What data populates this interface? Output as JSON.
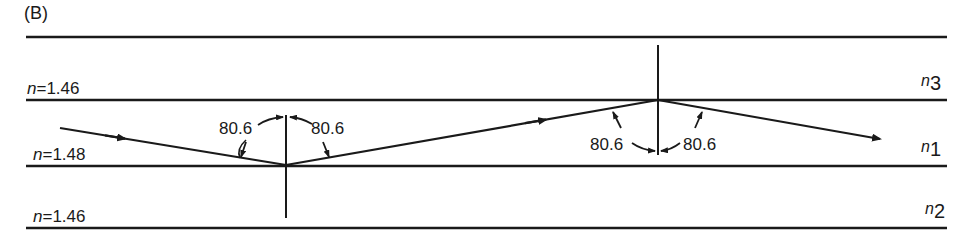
{
  "figure": {
    "panel_label": "(B)",
    "layers": [
      {
        "name": "cladding-top",
        "index_label": "n=1.46",
        "n_prefix": "n",
        "n_value": "=1.46",
        "symbol": "n",
        "symbol_sub": "3"
      },
      {
        "name": "core",
        "index_label": "n=1.48",
        "n_prefix": "n",
        "n_value": "=1.48",
        "symbol": "n",
        "symbol_sub": "1"
      },
      {
        "name": "cladding-bottom",
        "index_label": "n=1.46",
        "n_prefix": "n",
        "n_value": "=1.46",
        "symbol": "n",
        "symbol_sub": "2"
      }
    ],
    "angles": {
      "bottom_left": "80.6",
      "bottom_right": "80.6",
      "top_left": "80.6",
      "top_right": "80.6"
    },
    "colors": {
      "line": "#1a1a1a",
      "background": "#ffffff"
    }
  }
}
